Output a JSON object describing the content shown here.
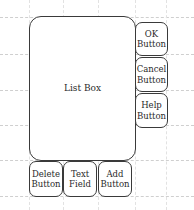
{
  "diagram": {
    "grid": {
      "horizontal_y": [
        17,
        54,
        90,
        125,
        160,
        196
      ],
      "vertical_x": [
        29,
        63,
        98,
        135,
        166
      ]
    },
    "list_box": {
      "label": "List Box"
    },
    "side_buttons": [
      {
        "id": "ok",
        "label": "OK\nButton"
      },
      {
        "id": "cancel",
        "label": "Cancel\nButton"
      },
      {
        "id": "help",
        "label": "Help\nButton"
      }
    ],
    "bottom_controls": [
      {
        "id": "delete",
        "label": "Delete\nButton"
      },
      {
        "id": "text-field",
        "label": "Text\nField"
      },
      {
        "id": "add",
        "label": "Add\nButton"
      }
    ]
  }
}
